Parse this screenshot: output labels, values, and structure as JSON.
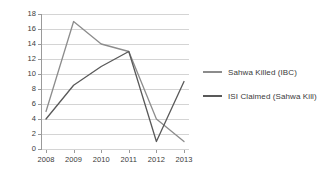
{
  "chart_data": {
    "type": "line",
    "title": "",
    "xlabel": "",
    "ylabel": "",
    "categories": [
      "2008",
      "2009",
      "2010",
      "2011",
      "2012",
      "2013"
    ],
    "ylim": [
      0,
      18
    ],
    "y_ticks": [
      0,
      2,
      4,
      6,
      8,
      10,
      12,
      14,
      16,
      18
    ],
    "y_tick_labels": [
      "0",
      "2",
      "4",
      "6",
      "8",
      "10",
      "12",
      "14",
      "16",
      "18"
    ],
    "grid": "horizontal",
    "legend_position": "right",
    "series": [
      {
        "name": "Sahwa Killed (IBC)",
        "color": "#8c8c8c",
        "values": [
          5,
          17,
          14,
          13,
          4,
          1
        ]
      },
      {
        "name": "ISI Claimed (Sahwa Kill)",
        "color": "#595959",
        "values": [
          4,
          8.5,
          11,
          13,
          1,
          9
        ]
      }
    ]
  },
  "legend": {
    "items": [
      {
        "label": "Sahwa Killed (IBC)",
        "swatch_name": "legend-swatch-sahwa-killed"
      },
      {
        "label": "ISI Claimed (Sahwa Kill)",
        "swatch_name": "legend-swatch-isi-claimed"
      }
    ]
  },
  "colors": {
    "series_light": "#8c8c8c",
    "series_dark": "#595959",
    "gridline": "#d4d4d4",
    "axis": "#9a9a9a",
    "text": "#3a3a3a",
    "background": "#ffffff"
  }
}
